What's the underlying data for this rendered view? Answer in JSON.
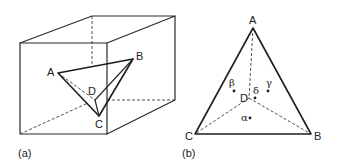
{
  "panel_a": {
    "caption": "(a)",
    "vertices": {
      "A": "A",
      "B": "B",
      "C": "C",
      "D": "D"
    }
  },
  "panel_b": {
    "caption": "(b)",
    "vertices": {
      "A": "A",
      "B": "B",
      "C": "C",
      "D": "D"
    },
    "phases": {
      "alpha": "α",
      "beta": "β",
      "gamma": "γ",
      "delta": "δ"
    }
  }
}
